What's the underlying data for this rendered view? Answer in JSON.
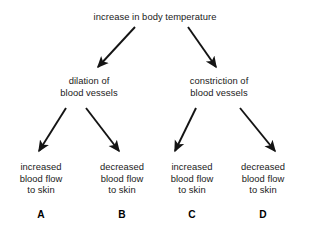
{
  "diagram": {
    "type": "flow-diagram",
    "background_color": "#ffffff",
    "text_color": "#1a1a1a",
    "arrow_color": "#141414",
    "root": {
      "id": "root",
      "lines": [
        "increase in body temperature"
      ]
    },
    "level2": [
      {
        "id": "dilation",
        "lines": [
          "dilation of",
          "blood vessels"
        ]
      },
      {
        "id": "constriction",
        "lines": [
          "constriction of",
          "blood vessels"
        ]
      }
    ],
    "level3": [
      {
        "id": "a",
        "lines": [
          "increased",
          "blood flow",
          "to skin"
        ],
        "label": "A"
      },
      {
        "id": "b",
        "lines": [
          "decreased",
          "blood flow",
          "to skin"
        ],
        "label": "B"
      },
      {
        "id": "c",
        "lines": [
          "increased",
          "blood flow",
          "to skin"
        ],
        "label": "C"
      },
      {
        "id": "d",
        "lines": [
          "decreased",
          "blood flow",
          "to skin"
        ],
        "label": "D"
      }
    ],
    "arrows": [
      {
        "id": "root-to-dilation",
        "from": [
          135,
          27
        ],
        "to": [
          96,
          70
        ],
        "direction": "down-left"
      },
      {
        "id": "root-to-constriction",
        "from": [
          188,
          27
        ],
        "to": [
          218,
          70
        ],
        "direction": "down-right"
      },
      {
        "id": "dilation-to-a",
        "from": [
          66,
          108
        ],
        "to": [
          36,
          155
        ],
        "direction": "down-left"
      },
      {
        "id": "dilation-to-b",
        "from": [
          86,
          108
        ],
        "to": [
          122,
          155
        ],
        "direction": "down-right"
      },
      {
        "id": "constriction-to-c",
        "from": [
          196,
          108
        ],
        "to": [
          192,
          155
        ],
        "direction": "down-left"
      },
      {
        "id": "constriction-to-d",
        "from": [
          240,
          108
        ],
        "to": [
          278,
          155
        ],
        "direction": "down-right"
      }
    ]
  }
}
